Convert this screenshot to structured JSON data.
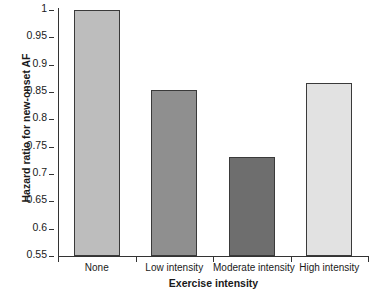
{
  "chart_data": {
    "type": "bar",
    "title": "",
    "xlabel": "Exercise intensity",
    "ylabel": "Hazard ratio for new-onset AF",
    "categories": [
      "None",
      "Low intensity",
      "Moderate intensity",
      "High intensity"
    ],
    "values": [
      1.0,
      0.853,
      0.731,
      0.866
    ],
    "ylim": [
      0.55,
      1.0
    ],
    "yticks": [
      "0.55",
      "0.6",
      "0.65",
      "0.7",
      "0.75",
      "0.8",
      "0.85",
      "0.9",
      "0.95",
      "1"
    ],
    "ytick_values": [
      0.55,
      0.6,
      0.65,
      0.7,
      0.75,
      0.8,
      0.85,
      0.9,
      0.95,
      1.0
    ],
    "grid": false,
    "legend": "none",
    "bar_colors": [
      "#bdbdbd",
      "#8f8f8f",
      "#6e6e6e",
      "#e2e2e2"
    ],
    "bar_edge_color": "#3a3a3a",
    "axis_color": "#333333",
    "background": "#ffffff"
  }
}
